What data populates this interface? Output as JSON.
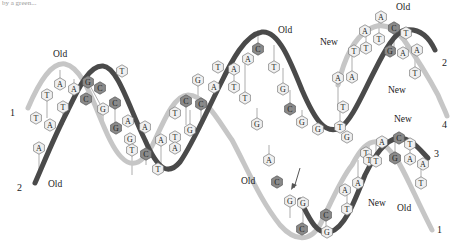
{
  "caption_fragment": "by a green...",
  "colors": {
    "old_strand_light": "#c8c8c8",
    "old_strand_dark": "#444444",
    "new_strand_light": "#c8c8c8",
    "new_strand_dark": "#444444",
    "base_light": "#f0f0f0",
    "base_dark": "#8a8a8a",
    "arrow": "#555555"
  },
  "labels": {
    "old_top_left": "Old",
    "old_bottom_left": "Old",
    "old_top_mid": "Old",
    "old_top_right": "Old",
    "new_upper_left": "New",
    "new_upper_right": "New",
    "new_lower_top": "New",
    "new_lower_mid": "New",
    "old_lower_mid": "Old",
    "old_lower_right": "Old"
  },
  "strand_numbers": {
    "left_1": "1",
    "left_2": "2",
    "right_2": "2",
    "right_4": "4",
    "right_3": "3",
    "right_1": "1"
  },
  "bases": [
    {
      "x": 122,
      "y": 71,
      "l": "T",
      "d": false
    },
    {
      "x": 60,
      "y": 84,
      "l": "A",
      "d": false
    },
    {
      "x": 74,
      "y": 89,
      "l": "A",
      "d": false
    },
    {
      "x": 88,
      "y": 82,
      "l": "G",
      "d": true
    },
    {
      "x": 100,
      "y": 88,
      "l": "C",
      "d": true
    },
    {
      "x": 47,
      "y": 95,
      "l": "T",
      "d": false
    },
    {
      "x": 63,
      "y": 107,
      "l": "T",
      "d": false
    },
    {
      "x": 86,
      "y": 99,
      "l": "C",
      "d": true
    },
    {
      "x": 103,
      "y": 109,
      "l": "G",
      "d": false
    },
    {
      "x": 115,
      "y": 103,
      "l": "C",
      "d": true
    },
    {
      "x": 36,
      "y": 118,
      "l": "T",
      "d": false
    },
    {
      "x": 50,
      "y": 125,
      "l": "A",
      "d": false
    },
    {
      "x": 128,
      "y": 121,
      "l": "A",
      "d": false
    },
    {
      "x": 116,
      "y": 128,
      "l": "G",
      "d": true
    },
    {
      "x": 39,
      "y": 148,
      "l": "A",
      "d": false
    },
    {
      "x": 130,
      "y": 139,
      "l": "G",
      "d": false
    },
    {
      "x": 145,
      "y": 127,
      "l": "A",
      "d": false
    },
    {
      "x": 132,
      "y": 150,
      "l": "T",
      "d": false
    },
    {
      "x": 146,
      "y": 154,
      "l": "C",
      "d": true
    },
    {
      "x": 161,
      "y": 140,
      "l": "A",
      "d": false
    },
    {
      "x": 175,
      "y": 137,
      "l": "T",
      "d": false
    },
    {
      "x": 175,
      "y": 148,
      "l": "A",
      "d": false
    },
    {
      "x": 158,
      "y": 169,
      "l": "T",
      "d": false
    },
    {
      "x": 190,
      "y": 130,
      "l": "G",
      "d": false
    },
    {
      "x": 186,
      "y": 101,
      "l": "C",
      "d": true
    },
    {
      "x": 201,
      "y": 104,
      "l": "C",
      "d": true
    },
    {
      "x": 175,
      "y": 113,
      "l": "T",
      "d": false
    },
    {
      "x": 198,
      "y": 80,
      "l": "G",
      "d": false
    },
    {
      "x": 214,
      "y": 87,
      "l": "A",
      "d": false
    },
    {
      "x": 218,
      "y": 67,
      "l": "T",
      "d": false
    },
    {
      "x": 234,
      "y": 69,
      "l": "A",
      "d": false
    },
    {
      "x": 248,
      "y": 59,
      "l": "A",
      "d": false
    },
    {
      "x": 234,
      "y": 87,
      "l": "T",
      "d": false
    },
    {
      "x": 245,
      "y": 98,
      "l": "T",
      "d": false
    },
    {
      "x": 258,
      "y": 49,
      "l": "C",
      "d": true
    },
    {
      "x": 274,
      "y": 67,
      "l": "T",
      "d": false
    },
    {
      "x": 283,
      "y": 89,
      "l": "G",
      "d": false
    },
    {
      "x": 290,
      "y": 109,
      "l": "C",
      "d": true
    },
    {
      "x": 302,
      "y": 122,
      "l": "G",
      "d": false
    },
    {
      "x": 257,
      "y": 124,
      "l": "G",
      "d": false
    },
    {
      "x": 318,
      "y": 129,
      "l": "G",
      "d": false
    },
    {
      "x": 340,
      "y": 127,
      "l": "T",
      "d": false
    },
    {
      "x": 347,
      "y": 137,
      "l": "G",
      "d": false
    },
    {
      "x": 269,
      "y": 160,
      "l": "A",
      "d": false
    },
    {
      "x": 277,
      "y": 182,
      "l": "C",
      "d": true
    },
    {
      "x": 290,
      "y": 201,
      "l": "G",
      "d": false
    },
    {
      "x": 303,
      "y": 203,
      "l": "G",
      "d": false
    },
    {
      "x": 302,
      "y": 229,
      "l": "C",
      "d": true
    },
    {
      "x": 326,
      "y": 215,
      "l": "C",
      "d": true
    },
    {
      "x": 347,
      "y": 209,
      "l": "T",
      "d": false
    },
    {
      "x": 327,
      "y": 232,
      "l": "G",
      "d": false
    },
    {
      "x": 345,
      "y": 190,
      "l": "A",
      "d": false
    },
    {
      "x": 358,
      "y": 183,
      "l": "A",
      "d": false
    },
    {
      "x": 366,
      "y": 153,
      "l": "T",
      "d": false
    },
    {
      "x": 369,
      "y": 160,
      "l": "T",
      "d": false
    },
    {
      "x": 382,
      "y": 142,
      "l": "A",
      "d": false
    },
    {
      "x": 376,
      "y": 161,
      "l": "T",
      "d": false
    },
    {
      "x": 399,
      "y": 138,
      "l": "C",
      "d": true
    },
    {
      "x": 395,
      "y": 158,
      "l": "G",
      "d": true
    },
    {
      "x": 410,
      "y": 144,
      "l": "T",
      "d": false
    },
    {
      "x": 410,
      "y": 159,
      "l": "A",
      "d": false
    },
    {
      "x": 423,
      "y": 164,
      "l": "A",
      "d": false
    },
    {
      "x": 421,
      "y": 183,
      "l": "T",
      "d": false
    },
    {
      "x": 338,
      "y": 78,
      "l": "A",
      "d": false
    },
    {
      "x": 352,
      "y": 77,
      "l": "A",
      "d": false
    },
    {
      "x": 343,
      "y": 107,
      "l": "T",
      "d": false
    },
    {
      "x": 354,
      "y": 51,
      "l": "T",
      "d": false
    },
    {
      "x": 366,
      "y": 48,
      "l": "T",
      "d": false
    },
    {
      "x": 365,
      "y": 31,
      "l": "A",
      "d": false
    },
    {
      "x": 379,
      "y": 39,
      "l": "T",
      "d": false
    },
    {
      "x": 381,
      "y": 17,
      "l": "A",
      "d": false
    },
    {
      "x": 394,
      "y": 28,
      "l": "C",
      "d": true
    },
    {
      "x": 390,
      "y": 51,
      "l": "G",
      "d": true
    },
    {
      "x": 406,
      "y": 33,
      "l": "T",
      "d": false
    },
    {
      "x": 403,
      "y": 53,
      "l": "A",
      "d": false
    },
    {
      "x": 417,
      "y": 50,
      "l": "A",
      "d": false
    },
    {
      "x": 415,
      "y": 73,
      "l": "T",
      "d": false
    }
  ]
}
